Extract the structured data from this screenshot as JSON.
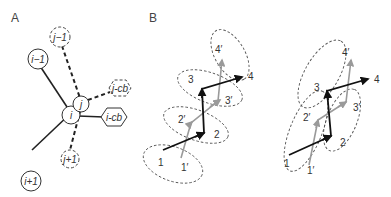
{
  "panels": {
    "A": {
      "label": "A",
      "nodes": {
        "i_minus_1": "i−1",
        "j_minus_1": "j−1",
        "j": "j",
        "i": "i",
        "j_cb": "j-cb",
        "i_cb": "i-cb",
        "i_plus_1": "i+1",
        "j_plus_1": "j+1"
      }
    },
    "B": {
      "label": "B",
      "left": {
        "labels": [
          "1",
          "1′",
          "2",
          "2′",
          "3",
          "3′",
          "4",
          "4′"
        ]
      },
      "right": {
        "labels": [
          "1",
          "1′",
          "2",
          "2′",
          "3",
          "3′",
          "4",
          "4′"
        ]
      }
    }
  },
  "colors": {
    "black_path": "#111111",
    "gray_path": "#9a9a9a"
  }
}
